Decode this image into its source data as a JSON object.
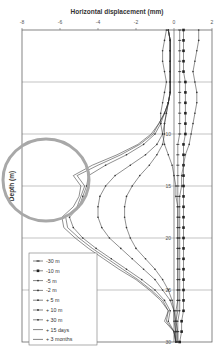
{
  "chart_data": {
    "type": "line",
    "title": "Horizontal displacement (mm)",
    "xlabel": "Horizontal displacement (mm)",
    "ylabel": "Depth (m)",
    "xlim": [
      -8,
      2
    ],
    "ylim": [
      30,
      0
    ],
    "x_ticks": [
      "-8",
      "-6",
      "-4",
      "-2",
      "0",
      "2"
    ],
    "y_ticks": [
      "5",
      "10",
      "15",
      "20",
      "25",
      "30"
    ],
    "y_tick_labels_visible": [
      "10",
      "15",
      "20",
      "25",
      "30"
    ],
    "grid": "horizontal",
    "legend_position": "lower-left",
    "annotation": "grey ellipse highlighting maximum displacement zone near depth 13-19 m, displacement -8 to -3.5 mm",
    "depths": [
      0,
      1,
      2,
      3,
      4,
      5,
      6,
      7,
      8,
      9,
      10,
      11,
      12,
      13,
      14,
      15,
      16,
      17,
      18,
      19,
      20,
      21,
      22,
      23,
      24,
      25,
      26,
      27,
      28,
      29,
      30
    ],
    "series": [
      {
        "name": "-30 m",
        "marker": "dash",
        "values": [
          0.3,
          0.3,
          0.3,
          0.3,
          0.3,
          0.3,
          0.3,
          0.3,
          0.3,
          0.3,
          0.3,
          0.2,
          0.2,
          0.2,
          0.2,
          0.2,
          0.2,
          0.2,
          0.2,
          0.2,
          0.2,
          0.2,
          0.2,
          0.2,
          0.2,
          0.2,
          0.2,
          0.2,
          0.1,
          0.2,
          0.2
        ]
      },
      {
        "name": "-10 m",
        "marker": "square",
        "values": [
          0.5,
          0.5,
          0.5,
          0.5,
          0.5,
          0.6,
          0.6,
          0.6,
          0.6,
          0.6,
          0.6,
          0.5,
          0.5,
          0.5,
          0.5,
          0.5,
          0.5,
          0.5,
          0.5,
          0.5,
          0.5,
          0.5,
          0.5,
          0.5,
          0.5,
          0.5,
          0.5,
          0.5,
          0.4,
          0.4,
          0.3
        ]
      },
      {
        "name": "-5 m",
        "marker": "plus",
        "values": [
          1.3,
          1.3,
          1.2,
          1.1,
          1.0,
          1.1,
          1.2,
          1.2,
          1.1,
          1.0,
          0.9,
          0.8,
          0.6,
          0.5,
          0.4,
          0.4,
          0.3,
          0.3,
          0.3,
          0.3,
          0.3,
          0.3,
          0.3,
          0.3,
          0.3,
          0.3,
          0.3,
          0.3,
          0.2,
          0.2,
          0.2
        ]
      },
      {
        "name": "-2 m",
        "marker": "plus",
        "values": [
          -0.4,
          -0.5,
          -0.6,
          -0.6,
          -0.5,
          -0.4,
          -0.5,
          -0.6,
          -0.7,
          -0.7,
          -0.6,
          -0.5,
          -0.3,
          -0.1,
          0.0,
          0.1,
          0.1,
          0.2,
          0.2,
          0.2,
          0.2,
          0.2,
          0.2,
          0.2,
          0.2,
          0.2,
          0.2,
          0.1,
          0.1,
          0.1,
          0.1
        ]
      },
      {
        "name": "+ 5 m",
        "marker": "plus",
        "values": [
          -0.3,
          -0.2,
          -0.2,
          -0.2,
          -0.2,
          -0.2,
          -0.2,
          -0.3,
          -0.4,
          -0.5,
          -0.5,
          -0.6,
          -0.9,
          -1.3,
          -1.8,
          -2.2,
          -2.5,
          -2.6,
          -2.6,
          -2.5,
          -2.3,
          -2.0,
          -1.5,
          -1.0,
          -0.6,
          -0.3,
          -0.1,
          0.0,
          0.1,
          0.1,
          0.1
        ]
      },
      {
        "name": "+ 10 m",
        "marker": "plus",
        "values": [
          -0.3,
          -0.2,
          -0.2,
          -0.2,
          -0.2,
          -0.2,
          -0.2,
          -0.3,
          -0.4,
          -0.5,
          -0.6,
          -0.9,
          -1.5,
          -2.3,
          -3.1,
          -3.6,
          -3.9,
          -4.0,
          -4.0,
          -3.8,
          -3.4,
          -2.8,
          -2.2,
          -1.6,
          -1.0,
          -0.6,
          -0.2,
          0.0,
          0.0,
          0.1,
          0.1
        ]
      },
      {
        "name": "+ 30 m",
        "marker": "plus",
        "values": [
          -0.3,
          -0.2,
          -0.2,
          -0.2,
          -0.2,
          -0.2,
          -0.2,
          -0.3,
          -0.5,
          -0.7,
          -1.0,
          -1.6,
          -2.5,
          -3.6,
          -4.5,
          -4.6,
          -4.8,
          -5.0,
          -5.5,
          -5.3,
          -4.8,
          -4.1,
          -3.3,
          -2.5,
          -1.7,
          -1.0,
          -0.5,
          -0.2,
          -0.3,
          0.0,
          0.1
        ]
      },
      {
        "name": "+ 15 days",
        "marker": "none",
        "values": [
          -0.3,
          -0.2,
          -0.2,
          -0.2,
          -0.2,
          -0.2,
          -0.2,
          -0.3,
          -0.5,
          -0.8,
          -1.1,
          -1.8,
          -2.8,
          -4.0,
          -5.1,
          -4.7,
          -4.9,
          -5.1,
          -5.7,
          -5.6,
          -5.0,
          -4.3,
          -3.5,
          -2.7,
          -1.9,
          -1.2,
          -0.6,
          -0.3,
          -0.4,
          0.0,
          0.1
        ]
      },
      {
        "name": "+ 3 months",
        "marker": "none",
        "values": [
          -0.3,
          -0.2,
          -0.2,
          -0.2,
          -0.2,
          -0.2,
          -0.2,
          -0.3,
          -0.5,
          -0.8,
          -1.2,
          -1.9,
          -3.0,
          -4.3,
          -5.3,
          -4.9,
          -5.0,
          -5.3,
          -5.9,
          -5.8,
          -5.2,
          -4.5,
          -3.7,
          -2.9,
          -2.0,
          -1.3,
          -0.7,
          -0.3,
          -0.5,
          0.0,
          0.1
        ]
      }
    ],
    "legend": [
      "-30 m",
      "-10 m",
      "-5 m",
      "-2 m",
      "+ 5 m",
      "+ 10 m",
      "+ 30 m",
      "+ 15 days",
      "+ 3 months"
    ]
  },
  "colors": {
    "frame": "#555555",
    "grid": "#aaaaaa",
    "lines": "#333333",
    "highlight": "#a8a8a8"
  }
}
